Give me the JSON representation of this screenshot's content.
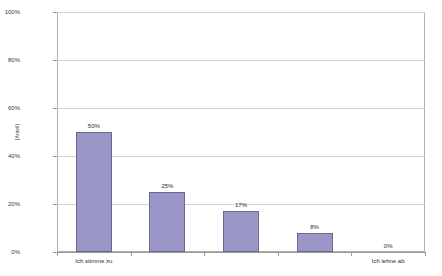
{
  "chart_data": {
    "type": "bar",
    "title": "",
    "subtitle": "",
    "xlabel": "",
    "ylabel": "[Anteil]",
    "categories": [
      "Ich stimme zu",
      "",
      "",
      "",
      "Ich lehne ab"
    ],
    "visible_category_labels": [
      {
        "index": 0,
        "text": "Ich stimme zu"
      },
      {
        "index": 4,
        "text": "Ich lehne ab"
      }
    ],
    "values": [
      50,
      25,
      17,
      8,
      0
    ],
    "data_labels": [
      "50%",
      "25%",
      "17%",
      "8%",
      "0%"
    ],
    "ylim": [
      0,
      100
    ],
    "y_ticks": [
      0,
      20,
      40,
      60,
      80,
      100
    ],
    "y_tick_labels": [
      "0%",
      "20%",
      "40%",
      "60%",
      "80%",
      "100%"
    ],
    "grid": true,
    "grid_axis": "y",
    "legend": false,
    "legend_position": "none",
    "series": [
      {
        "name": "Anteil",
        "values": [
          50,
          25,
          17,
          8,
          0
        ]
      }
    ],
    "colors": {
      "bar_fill": "#9a96c8",
      "bar_border": "#6b6791",
      "gridline": "#d4d4d4",
      "axis_line": "#9a9a9a",
      "plot_border": "#b0b0b0",
      "text": "#2b2b2b",
      "background": "#ffffff"
    }
  }
}
